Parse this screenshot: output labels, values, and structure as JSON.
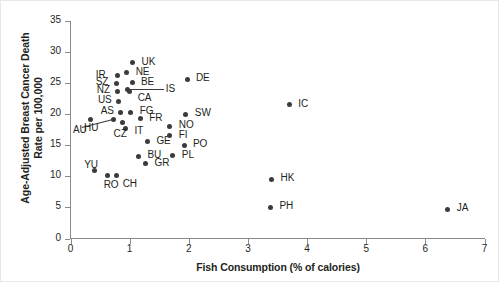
{
  "chart_data": {
    "type": "scatter",
    "title": "",
    "xlabel": "Fish Consumption (% of calories)",
    "ylabel": "Age-Adjusted Breast Cancer Death Rate per 100,000",
    "ylabel_line1": "Age-Adjusted Breast Cancer Death",
    "ylabel_line2": "Rate per 100,000",
    "xlim": [
      0,
      7
    ],
    "ylim": [
      0,
      35
    ],
    "xticks": [
      "0",
      "1",
      "2",
      "3",
      "4",
      "5",
      "6",
      "7"
    ],
    "yticks": [
      "0",
      "5",
      "10",
      "15",
      "20",
      "25",
      "30",
      "35"
    ],
    "grid": false,
    "legend": false,
    "marker_color": "#3b3b3b",
    "axis_color": "#8a8a8a",
    "points": [
      {
        "label": "UK",
        "x": 1.05,
        "y": 28.3,
        "lx": 9,
        "ly": -6
      },
      {
        "label": "NE",
        "x": 0.95,
        "y": 26.7,
        "lx": 9,
        "ly": -6
      },
      {
        "label": "IR",
        "x": 0.8,
        "y": 26.2,
        "lx": -22,
        "ly": -6
      },
      {
        "label": "BE",
        "x": 1.04,
        "y": 25.1,
        "lx": 9,
        "ly": -6
      },
      {
        "label": "SZ",
        "x": 0.78,
        "y": 25.0,
        "lx": -21,
        "ly": -6
      },
      {
        "label": "CA",
        "x": 1.0,
        "y": 23.6,
        "lx": 8,
        "ly": 1
      },
      {
        "label": "NZ",
        "x": 0.8,
        "y": 23.7,
        "lx": -21,
        "ly": -6
      },
      {
        "label": "IS",
        "x": 0.97,
        "y": 24.0,
        "lx": 38,
        "ly": -5,
        "leader": true
      },
      {
        "label": "US",
        "x": 0.82,
        "y": 22.1,
        "lx": -21,
        "ly": -6
      },
      {
        "label": "FG",
        "x": 1.02,
        "y": 20.3,
        "lx": 9,
        "ly": -6
      },
      {
        "label": "AS",
        "x": 0.85,
        "y": 20.2,
        "lx": -20,
        "ly": -7
      },
      {
        "label": "FR",
        "x": 1.18,
        "y": 19.3,
        "lx": 9,
        "ly": -6
      },
      {
        "label": "HU",
        "x": 0.72,
        "y": 19.1,
        "lx": -29,
        "ly": 3,
        "leader": true
      },
      {
        "label": "AU",
        "x": 0.33,
        "y": 19.2,
        "lx": -17,
        "ly": 6
      },
      {
        "label": "IT",
        "x": 0.93,
        "y": 17.7,
        "lx": 9,
        "ly": -3
      },
      {
        "label": "CZ",
        "x": 0.88,
        "y": 18.6,
        "lx": -9,
        "ly": 6
      },
      {
        "label": "GE",
        "x": 1.3,
        "y": 15.6,
        "lx": 9,
        "ly": -6
      },
      {
        "label": "PL",
        "x": 1.73,
        "y": 13.3,
        "lx": 9,
        "ly": -6
      },
      {
        "label": "BU",
        "x": 1.15,
        "y": 13.2,
        "lx": 9,
        "ly": -6
      },
      {
        "label": "GR",
        "x": 1.27,
        "y": 12.0,
        "lx": 9,
        "ly": -6
      },
      {
        "label": "YU",
        "x": 0.4,
        "y": 11.0,
        "lx": -10,
        "ly": -10
      },
      {
        "label": "RO",
        "x": 0.63,
        "y": 10.1,
        "lx": -4,
        "ly": 4
      },
      {
        "label": "CH",
        "x": 0.78,
        "y": 10.1,
        "lx": 6,
        "ly": 3
      },
      {
        "label": "DE",
        "x": 1.97,
        "y": 25.6,
        "lx": 9,
        "ly": -6
      },
      {
        "label": "SW",
        "x": 1.95,
        "y": 20.0,
        "lx": 9,
        "ly": -6
      },
      {
        "label": "NO",
        "x": 1.68,
        "y": 18.1,
        "lx": 9,
        "ly": -6
      },
      {
        "label": "FI",
        "x": 1.68,
        "y": 16.5,
        "lx": 9,
        "ly": -6
      },
      {
        "label": "PO",
        "x": 1.92,
        "y": 15.0,
        "lx": 9,
        "ly": -6
      },
      {
        "label": "IC",
        "x": 3.7,
        "y": 21.5,
        "lx": 9,
        "ly": -6
      },
      {
        "label": "HK",
        "x": 3.4,
        "y": 9.5,
        "lx": 9,
        "ly": -6
      },
      {
        "label": "PH",
        "x": 3.38,
        "y": 5.0,
        "lx": 9,
        "ly": -6
      },
      {
        "label": "JA",
        "x": 6.38,
        "y": 4.7,
        "lx": 9,
        "ly": -6
      }
    ]
  }
}
